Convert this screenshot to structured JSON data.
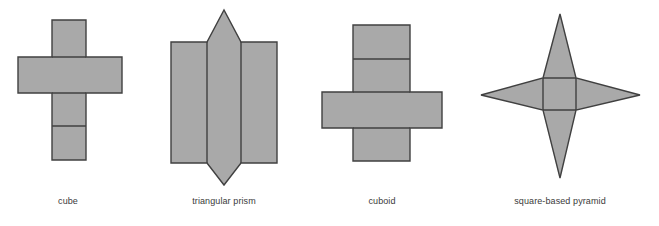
{
  "figure": {
    "width": 659,
    "height": 226,
    "background": "#ffffff",
    "fill_color": "#a9a9a9",
    "stroke_color": "#404040",
    "label_color": "#3a3a3a",
    "stroke_width": 1.4
  },
  "nets": [
    {
      "id": "cube",
      "label": "cube",
      "shape_type": "net",
      "solid": "cube",
      "face_count": 6,
      "label_x": 68,
      "label_y": 196,
      "description": "cross-shaped net of six squares",
      "outline": "52,20 86,20 86,57 122,57 122,93 86,93 86,160 52,160 52,93 18,93 18,57 52,57",
      "fold_lines": [
        "52,57 86,57",
        "52,93 86,93",
        "52,126 86,126"
      ]
    },
    {
      "id": "triangular-prism",
      "label": "triangular prism",
      "shape_type": "net",
      "solid": "triangular prism",
      "face_count": 5,
      "label_x": 224,
      "label_y": 196,
      "description": "three rectangles in a row with a triangle above and below the middle rectangle",
      "outline": "171,42 207,42 224,10 241,42 277,42 277,163 241,163 224,185 207,163 171,163",
      "fold_lines": [
        "207,42 207,163",
        "241,42 241,163"
      ]
    },
    {
      "id": "cuboid",
      "label": "cuboid",
      "shape_type": "net",
      "solid": "cuboid",
      "face_count": 6,
      "label_x": 382,
      "label_y": 196,
      "description": "cross-shaped net of six rectangles",
      "outline": "353,25 410,25 410,92 442,92 442,128 410,128 410,161 353,161 353,128 322,128 322,92 353,92",
      "fold_lines": [
        "353,59 410,59",
        "353,92 410,92",
        "353,128 410,128"
      ]
    },
    {
      "id": "square-based-pyramid",
      "label": "square-based pyramid",
      "shape_type": "net",
      "solid": "square-based pyramid",
      "face_count": 5,
      "label_x": 560,
      "label_y": 196,
      "description": "central square with four triangles forming a four-pointed star",
      "outline": "543,78 560,14 576,78 640,95 576,110 560,178 543,110 481,95",
      "fold_lines": [
        "543,78 576,78",
        "576,78 576,110",
        "576,110 543,110",
        "543,110 543,78"
      ]
    }
  ]
}
